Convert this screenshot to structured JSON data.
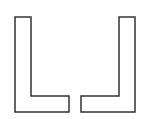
{
  "canvas": {
    "width": 142,
    "height": 119,
    "background": "#ffffff"
  },
  "style": {
    "stroke": "#333333",
    "stroke_width": 1.5,
    "fill": "#ffffff"
  },
  "shapes": [
    {
      "name": "left-l-bracket",
      "points": "15,17 31,17 31,96 69,96 69,112 15,112"
    },
    {
      "name": "right-l-bracket",
      "points": "119,17 135,17 135,112 81,112 81,96 119,96"
    }
  ]
}
